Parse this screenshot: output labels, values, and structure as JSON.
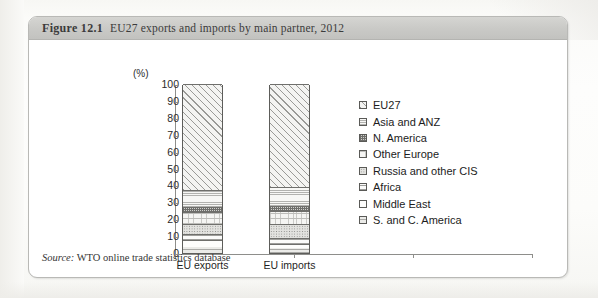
{
  "figure": {
    "number": "Figure 12.1",
    "caption": "EU27 exports and imports by main partner, 2012",
    "source_prefix": "Source:",
    "source_text": "WTO online trade statistics database"
  },
  "chart_data": {
    "type": "bar",
    "title": "EU27 exports and imports by main partner, 2012",
    "subtitle": "",
    "xlabel": "",
    "ylabel": "(%)",
    "ylim": [
      0,
      100
    ],
    "yticks": [
      0,
      10,
      20,
      30,
      40,
      50,
      60,
      70,
      80,
      90,
      100
    ],
    "ytick_labels": [
      "0",
      "10",
      "20",
      "30",
      "40",
      "50",
      "60",
      "70",
      "80",
      "90",
      "100"
    ],
    "grid": false,
    "stacked": true,
    "legend_position": "right",
    "categories": [
      "EU exports",
      "EU imports"
    ],
    "series": [
      {
        "name": "S. and C. America",
        "pattern": "light-grid",
        "values": [
          3.5,
          3.0
        ]
      },
      {
        "name": "Middle East",
        "pattern": "plain",
        "values": [
          4.0,
          2.5
        ]
      },
      {
        "name": "Africa",
        "pattern": "h-wide",
        "values": [
          3.5,
          3.5
        ]
      },
      {
        "name": "Russia and other CIS",
        "pattern": "dots",
        "values": [
          6.0,
          8.0
        ]
      },
      {
        "name": "Other Europe",
        "pattern": "grid-fine",
        "values": [
          7.0,
          8.0
        ]
      },
      {
        "name": "N. America",
        "pattern": "check",
        "values": [
          3.0,
          3.0
        ]
      },
      {
        "name": "Asia and ANZ",
        "pattern": "h-fine",
        "values": [
          10.0,
          11.0
        ]
      },
      {
        "name": "EU27",
        "pattern": "diagonal",
        "values": [
          63.0,
          61.0
        ]
      }
    ]
  },
  "legend": {
    "items": [
      {
        "label": "EU27"
      },
      {
        "label": "Asia and ANZ"
      },
      {
        "label": "N. America"
      },
      {
        "label": "Other Europe"
      },
      {
        "label": "Russia and other CIS"
      },
      {
        "label": "Africa"
      },
      {
        "label": "Middle East"
      },
      {
        "label": "S. and C. America"
      }
    ]
  },
  "colors": {
    "caption_band": "#c9c9c6",
    "card_border": "#b9b9b6",
    "axis": "#8e8e8b",
    "text": "#1f1f1f"
  }
}
